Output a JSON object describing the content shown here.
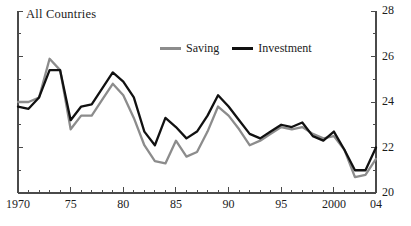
{
  "chart_data": {
    "type": "line",
    "title": "All Countries",
    "xlabel": "",
    "ylabel": "",
    "ylim": [
      20,
      28
    ],
    "xlim": [
      1970,
      2004
    ],
    "grid": false,
    "y_axis_side": "right",
    "legend_position": "top-center",
    "y_ticks": [
      20,
      22,
      24,
      26,
      28
    ],
    "y_tick_labels": [
      "20",
      "22",
      "24",
      "26",
      "28"
    ],
    "y_minor_step": 1,
    "x_ticks": [
      1970,
      1975,
      1980,
      1985,
      1990,
      1995,
      2000,
      2004
    ],
    "x_tick_labels": [
      "1970",
      "75",
      "80",
      "85",
      "90",
      "95",
      "2000",
      "04"
    ],
    "x_minor_step": 1,
    "x": [
      1970,
      1971,
      1972,
      1973,
      1974,
      1975,
      1976,
      1977,
      1978,
      1979,
      1980,
      1981,
      1982,
      1983,
      1984,
      1985,
      1986,
      1987,
      1988,
      1989,
      1990,
      1991,
      1992,
      1993,
      1994,
      1995,
      1996,
      1997,
      1998,
      1999,
      2000,
      2001,
      2002,
      2003,
      2004
    ],
    "series": [
      {
        "name": "Saving",
        "color": "#8c8c8c",
        "values": [
          24.0,
          24.0,
          24.2,
          25.9,
          25.4,
          22.8,
          23.4,
          23.4,
          24.1,
          24.8,
          24.3,
          23.3,
          22.1,
          21.4,
          21.3,
          22.3,
          21.6,
          21.8,
          22.7,
          23.8,
          23.4,
          22.8,
          22.1,
          22.3,
          22.6,
          22.9,
          22.8,
          22.9,
          22.6,
          22.4,
          22.5,
          21.9,
          20.7,
          20.8,
          21.5
        ]
      },
      {
        "name": "Investment",
        "color": "#111111",
        "values": [
          23.8,
          23.7,
          24.2,
          25.4,
          25.4,
          23.2,
          23.8,
          23.9,
          24.6,
          25.3,
          24.9,
          24.2,
          22.7,
          22.1,
          23.3,
          22.9,
          22.4,
          22.7,
          23.4,
          24.3,
          23.8,
          23.2,
          22.6,
          22.4,
          22.7,
          23.0,
          22.9,
          23.1,
          22.5,
          22.3,
          22.7,
          21.9,
          21.0,
          21.0,
          22.0
        ]
      }
    ]
  },
  "legend": {
    "items": [
      {
        "label": "Saving",
        "color": "#8c8c8c"
      },
      {
        "label": "Investment",
        "color": "#111111"
      }
    ]
  },
  "axes": {
    "left_axis_visible": true,
    "right_axis_visible": true,
    "bottom_axis_visible": true,
    "axis_color": "#4a4a4a"
  }
}
